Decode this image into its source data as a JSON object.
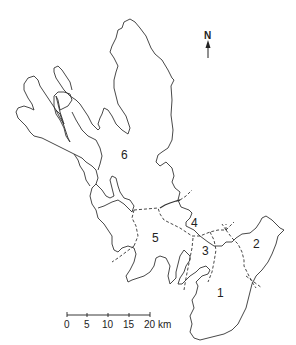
{
  "map": {
    "type": "regional outline map",
    "north_label": "N",
    "regions": [
      {
        "id": "1",
        "label": "1",
        "x": 218,
        "y": 293
      },
      {
        "id": "2",
        "label": "2",
        "x": 253,
        "y": 244
      },
      {
        "id": "3",
        "label": "3",
        "x": 202,
        "y": 251
      },
      {
        "id": "4",
        "label": "4",
        "x": 191,
        "y": 224
      },
      {
        "id": "5",
        "label": "5",
        "x": 152,
        "y": 238
      },
      {
        "id": "6",
        "label": "6",
        "x": 121,
        "y": 158
      }
    ],
    "scale_bar": {
      "ticks": [
        "0",
        "5",
        "10",
        "15",
        "20"
      ],
      "unit": "km",
      "last_label": "20 km"
    },
    "colors": {
      "line": "#333333",
      "background": "#ffffff"
    }
  }
}
